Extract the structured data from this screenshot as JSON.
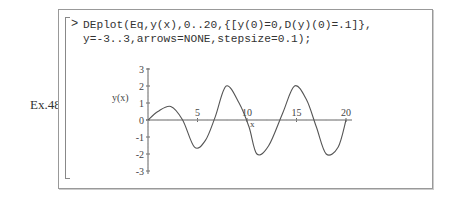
{
  "example_label": "Ex.48",
  "worksheet": {
    "prompt_symbol": ">",
    "code_lines": [
      "DEplot(Eq,y(x),0..20,{[y(0)=0,D(y)(0)=.1]},",
      "y=-3..3,arrows=NONE,stepsize=0.1);"
    ]
  },
  "chart_data": {
    "type": "line",
    "title": "",
    "xlabel": "x",
    "ylabel": "y(x)",
    "xlim": [
      0,
      20
    ],
    "ylim": [
      -3,
      3
    ],
    "x_ticks": [
      "5",
      "10",
      "15",
      "20"
    ],
    "y_ticks": [
      "3",
      "2",
      "1",
      "0",
      "-1",
      "-2",
      "-3"
    ],
    "grid": false,
    "legend": null,
    "series": [
      {
        "name": "y(x)",
        "x": [
          0,
          1,
          2.3,
          3.5,
          4.7,
          5.8,
          6.8,
          7.9,
          9.2,
          10.2,
          11.0,
          12.2,
          13.6,
          14.8,
          16.0,
          17.0,
          18.0,
          19.2,
          20
        ],
        "values": [
          0,
          0.5,
          0.8,
          0.0,
          -1.6,
          -1.2,
          0.2,
          2.0,
          1.0,
          -0.4,
          -2.0,
          -1.5,
          0.4,
          2.0,
          1.2,
          -0.4,
          -2.0,
          -1.6,
          0.0
        ]
      }
    ]
  }
}
